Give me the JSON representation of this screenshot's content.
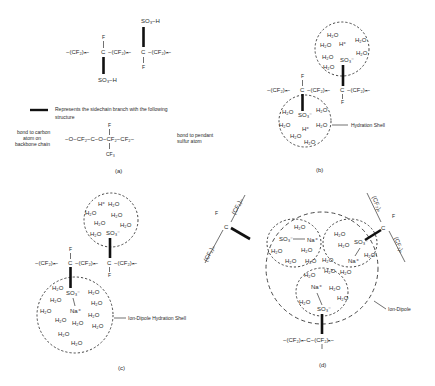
{
  "figure": {
    "panels": {
      "a": {
        "label": "(a)",
        "backbone": {
          "left": "−(CF₂)ₙ−C−(CF₂)ₙ−C−(CF₂)ₙ−",
          "seg1": "−(CF₂)ₙ−",
          "c": "C",
          "seg2": "−(CF₂)ₙ−",
          "seg3": "−(CF₂)ₙ−",
          "f": "F",
          "so3h": "SO₃−H"
        },
        "legend_text": "Represents the sidechain branch with the following",
        "legend_text2": "structure",
        "side_chain": {
          "left_note_1": "bond to carbon",
          "left_note_2": "atom on",
          "left_note_3": "backbone chain",
          "formula": "−O−CF₂−C−O−CF₂−CF₂−",
          "f": "F",
          "cf3": "CF₃",
          "right_note_1": "bond to pendant",
          "right_note_2": "sulfur atom"
        }
      },
      "b": {
        "label": "(b)",
        "h2o": "H₂O",
        "h_plus": "H⁺",
        "so3": "SO₃⁻",
        "annotation": "Hydration Shell",
        "backbone_seg": "−(CF₂)ₙ−",
        "c": "C",
        "f": "F"
      },
      "c": {
        "label": "(c)",
        "h2o": "H₂O",
        "h_plus": "H⁺",
        "so3": "SO₃⁻",
        "na": "Na⁺",
        "annotation": "Ion-Dipole Hydration Shell",
        "backbone_seg": "−(CF₂)ₙ−",
        "c": "C",
        "f": "F"
      },
      "d": {
        "label": "(d)",
        "h2o": "H₂O",
        "so3": "SO₃⁻",
        "na": "Na⁺",
        "annotation": "Ion-Dipole",
        "backbone_seg": "(CF₂)ₙ",
        "bottom_chain": "−(CF₂)ₙ−C−(CF₂)ₙ−",
        "c": "C",
        "f": "F"
      }
    }
  }
}
